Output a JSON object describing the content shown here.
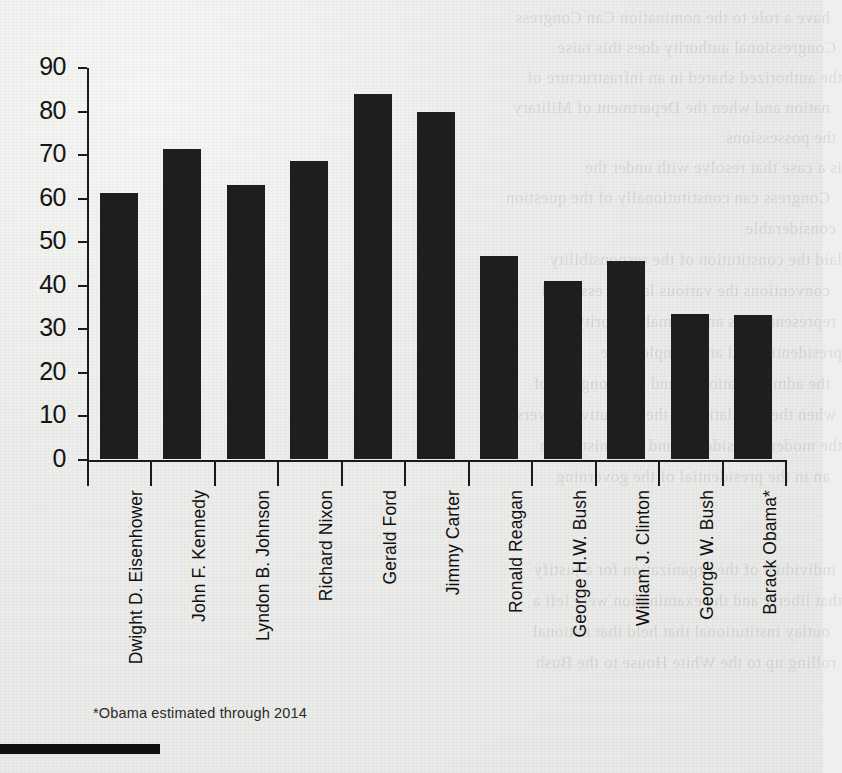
{
  "chart_data": {
    "type": "bar",
    "title": "",
    "subtitle": "",
    "xlabel": "",
    "ylabel": "",
    "ylim": [
      0,
      90
    ],
    "yticks": [
      0,
      10,
      20,
      30,
      40,
      50,
      60,
      70,
      80,
      90
    ],
    "grid": false,
    "legend": null,
    "orientation": "vertical",
    "bar_color": "#1e1e1e",
    "categories": [
      "Dwight D. Eisenhower",
      "John F. Kennedy",
      "Lyndon B. Johnson",
      "Richard Nixon",
      "Gerald Ford",
      "Jimmy Carter",
      "Ronald Reagan",
      "George H.W. Bush",
      "William J. Clinton",
      "George W. Bush",
      "Barack Obama*"
    ],
    "values": [
      61,
      71.2,
      62.8,
      68.5,
      83.8,
      79.6,
      46.7,
      40.8,
      45.4,
      33.2,
      33.0
    ],
    "annotations": [
      "*Obama estimated through 2014"
    ]
  },
  "footnote": {
    "text": "*Obama estimated through 2014"
  },
  "axis": {
    "y_tick_labels": [
      "90",
      "80",
      "70",
      "60",
      "50",
      "40",
      "30",
      "20",
      "10",
      "0"
    ]
  },
  "page_bleed": {
    "lines": [
      "have a role to the nomination  Can Congress",
      "Congressional authority does this raise",
      "the authorized shared in an infrastructure of",
      "nation and when the Department of Military",
      "the possessions",
      "is a case that resolve with under the",
      "Congress can constitutionally of the question",
      "considerable",
      "laid the constitution of the responsibility",
      "conventions the various law an essential",
      "representatives and formal authority the",
      "presidential and an example there",
      "the administration in and the Congress of",
      "when the legislative of the executive powers",
      "the modern presidency and administration",
      "an in the presidential of the governing",
      "individual of the organization for a justify",
      "that liberty and the examination were left a",
      "outlay institutional that held that national",
      "rolling up to the White House to the Bush"
    ]
  }
}
